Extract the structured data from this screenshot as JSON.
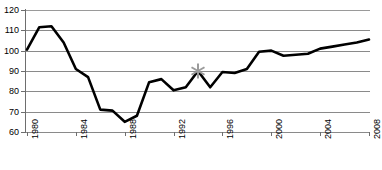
{
  "chart_data": {
    "type": "line",
    "title": "",
    "subtitle": "",
    "xlabel": "",
    "ylabel": "",
    "xlim": [
      1980,
      2008
    ],
    "ylim": [
      60,
      120
    ],
    "grid": true,
    "legend": "none",
    "y_ticks": [
      60,
      70,
      80,
      90,
      100,
      110,
      120
    ],
    "x_ticks": [
      1980,
      1984,
      1988,
      1992,
      1996,
      2000,
      2004,
      2008
    ],
    "x_tick_labels": [
      "1980",
      "1984",
      "1988",
      "1992",
      "1996",
      "2000",
      "2004",
      "2008"
    ],
    "y_tick_labels": [
      "60",
      "70",
      "80",
      "90",
      "100",
      "110",
      "120"
    ],
    "x": [
      1980,
      1981,
      1982,
      1983,
      1984,
      1985,
      1986,
      1987,
      1988,
      1989,
      1990,
      1991,
      1992,
      1993,
      1994,
      1995,
      1996,
      1997,
      1998,
      1999,
      2000,
      2001,
      2002,
      2003,
      2004,
      2005,
      2006,
      2007,
      2008
    ],
    "series": [
      {
        "name": "series-1",
        "color": "#000000",
        "line_width": 2.6,
        "values": [
          100.5,
          111.5,
          112.0,
          104.0,
          91.0,
          87.0,
          71.0,
          70.5,
          65.0,
          68.0,
          84.5,
          86.0,
          80.5,
          82.0,
          90.0,
          82.0,
          89.5,
          89.0,
          91.0,
          99.5,
          100.0,
          97.5,
          98.0,
          98.5,
          101.0,
          102.0,
          103.0,
          104.0,
          105.5
        ]
      }
    ],
    "annotations": [
      {
        "name": "asterisk-marker",
        "glyph": "asterisk",
        "x": 1994,
        "y": 90.0,
        "color": "#9b9b9b"
      }
    ],
    "colors": {
      "line": "#000000",
      "grid": "#8a8a8a",
      "axis": "#6e6e6e",
      "marker": "#9b9b9b",
      "background": "#ffffff",
      "text": "#000000"
    }
  }
}
